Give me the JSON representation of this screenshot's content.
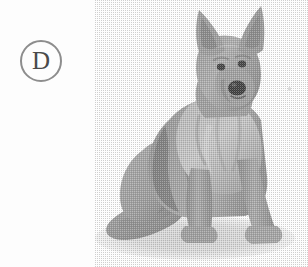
{
  "figure": {
    "panel_letter": "D",
    "background_color": "#fdfdfd",
    "rendering": "grayscale halftone photograph",
    "label_ring_color": "#8d8d8d",
    "label_text_color": "#4a4a4a",
    "icons": {
      "panel-badge": "circle-letter-icon",
      "speck": "dust-speck-icon"
    },
    "tones": {
      "ground_shadow": "#dcdcdc",
      "ground_shadow_edge": "#cfcfcf",
      "fur_light": "#c4c4c4",
      "fur_mid": "#a2a2a2",
      "fur_base": "#9a9a9a",
      "fur_shade": "#828282",
      "fur_dark": "#6c6c6c",
      "fur_darkest": "#555555",
      "nose": "#3a3a3a",
      "eye": "#3f3f3f",
      "highlight": "#d6d6d6",
      "speck": "#d8d8d8"
    }
  }
}
